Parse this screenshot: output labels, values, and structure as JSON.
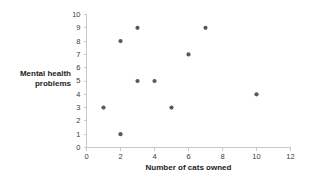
{
  "chart_data": {
    "type": "scatter",
    "title": "",
    "xlabel": "Number of cats owned",
    "ylabel": "Mental health problems",
    "ylabel_lines": [
      "Mental health",
      "problems"
    ],
    "xlim": [
      0,
      12
    ],
    "ylim": [
      0,
      10
    ],
    "xticks": [
      0,
      2,
      4,
      6,
      8,
      10,
      12
    ],
    "yticks": [
      0,
      1,
      2,
      3,
      4,
      5,
      6,
      7,
      8,
      9,
      10
    ],
    "xtick_labels": [
      "0",
      "2",
      "4",
      "6",
      "8",
      "10",
      "12"
    ],
    "ytick_labels": [
      "0",
      "1",
      "2",
      "3",
      "4",
      "5",
      "6",
      "7",
      "8",
      "9",
      "10"
    ],
    "grid": false,
    "legend": null,
    "marker_color": "#595959",
    "axis_color": "#c9c9c9",
    "background_color": "#ffffff",
    "points": [
      {
        "x": 1,
        "y": 3
      },
      {
        "x": 2,
        "y": 8
      },
      {
        "x": 2,
        "y": 1
      },
      {
        "x": 3,
        "y": 9
      },
      {
        "x": 3,
        "y": 5
      },
      {
        "x": 4,
        "y": 5
      },
      {
        "x": 5,
        "y": 3
      },
      {
        "x": 6,
        "y": 7
      },
      {
        "x": 7,
        "y": 9
      },
      {
        "x": 10,
        "y": 4
      }
    ]
  }
}
